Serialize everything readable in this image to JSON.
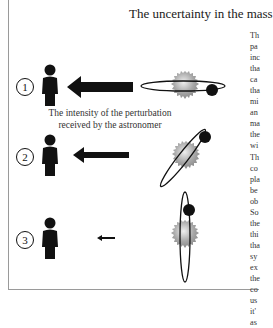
{
  "page": {
    "title": "The uncertainty in the mass",
    "caption_lines": [
      "The intensity of the perturbation",
      "received by the astronomer"
    ],
    "scenarios": [
      {
        "number": "1",
        "arrow_size": "large",
        "orbit_orientation": "edge-on horizontal"
      },
      {
        "number": "2",
        "arrow_size": "medium",
        "orbit_orientation": "inclined"
      },
      {
        "number": "3",
        "arrow_size": "small",
        "orbit_orientation": "near face-on vertical"
      }
    ],
    "body_text_fragments": [
      "Th",
      "pa",
      "inc",
      "tha",
      "ca",
      "tha",
      "mi",
      "an",
      "ma",
      "the",
      "wi",
      "Th",
      "co",
      "pla",
      "be",
      "ob",
      "So",
      "the",
      "thi",
      "tha",
      "sy",
      "ex",
      "the",
      "co",
      "us",
      "it'",
      "as"
    ]
  },
  "colors": {
    "ink": "#111111",
    "frame": "#9a9a9a",
    "star_light": "#e6e6e6",
    "star_dark": "#8a8a8a"
  }
}
